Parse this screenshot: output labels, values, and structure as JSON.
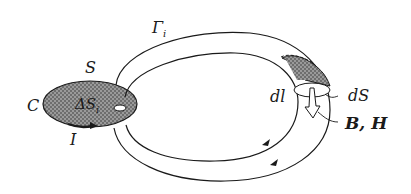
{
  "diagram": {
    "type": "magnetic-circuit-toroid",
    "labels": {
      "gamma": "Γ",
      "gamma_sub": "i",
      "surface": "S",
      "contour": "C",
      "delta_s": "ΔS",
      "delta_s_sub": "i",
      "current": "I",
      "dl": "dl",
      "ds": "dS",
      "fields": "B, H"
    },
    "colors": {
      "line": "#1a1a1a",
      "shade": "#8a8a8a",
      "background": "#ffffff"
    }
  }
}
